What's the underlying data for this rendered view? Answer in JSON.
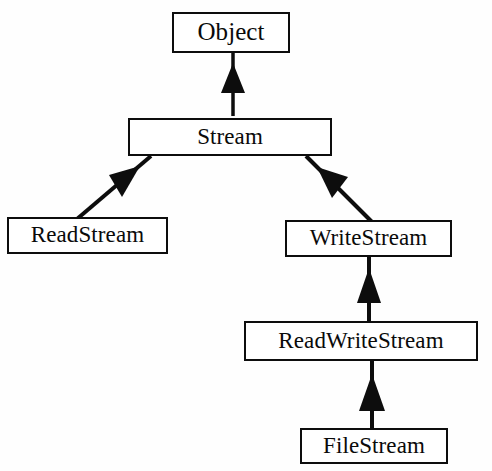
{
  "diagram": {
    "type": "uml-class-inheritance",
    "background_color": "#fefefe",
    "line_color": "#0d0d0d",
    "box_fill_color": "#ffffff",
    "nodes": [
      {
        "id": "object",
        "label": "Object"
      },
      {
        "id": "stream",
        "label": "Stream"
      },
      {
        "id": "readstream",
        "label": "ReadStream"
      },
      {
        "id": "writestream",
        "label": "WriteStream"
      },
      {
        "id": "readwritestream",
        "label": "ReadWriteStream"
      },
      {
        "id": "filestream",
        "label": "FileStream"
      }
    ],
    "edges": [
      {
        "id": "stream-to-object",
        "from": "stream",
        "to": "object",
        "style": "solid-filled-triangle-arrow"
      },
      {
        "id": "readstream-to-stream",
        "from": "readstream",
        "to": "stream",
        "style": "solid-filled-triangle-arrow"
      },
      {
        "id": "writestream-to-stream",
        "from": "writestream",
        "to": "stream",
        "style": "solid-filled-triangle-arrow"
      },
      {
        "id": "readwritestream-to-writestream",
        "from": "readwritestream",
        "to": "writestream",
        "style": "solid-filled-triangle-arrow"
      },
      {
        "id": "filestream-to-readwritestream",
        "from": "filestream",
        "to": "readwritestream",
        "style": "solid-filled-triangle-arrow"
      }
    ]
  }
}
